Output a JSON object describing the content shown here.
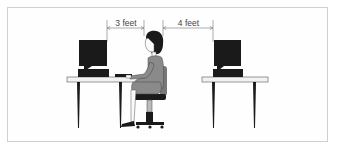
{
  "diagram": {
    "title": "",
    "measurements": [
      {
        "label": "3 feet",
        "from": "left-monitor",
        "to": "person-head"
      },
      {
        "label": "4 feet",
        "from": "person-back",
        "to": "right-monitor"
      }
    ],
    "elements": [
      "left-desk-with-computer",
      "seated-person-on-chair",
      "right-desk-with-computer"
    ],
    "colors": {
      "ink": "#1a1a1a",
      "person_fill": "#8a8a8a",
      "desk_top": "#f2f2f2",
      "frame": "#d0d0d0"
    }
  }
}
